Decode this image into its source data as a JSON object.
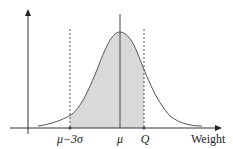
{
  "diagram": {
    "type": "normal-distribution-curve",
    "x_axis_label": "Weight",
    "markers": [
      {
        "id": "mu-minus-3sigma",
        "label": "μ−3σ",
        "line": "dashed"
      },
      {
        "id": "mu",
        "label": "μ",
        "line": "solid"
      },
      {
        "id": "q",
        "label": "Q",
        "line": "dashed"
      }
    ],
    "shaded_region": {
      "from": "μ−3σ",
      "to": "Q"
    },
    "colors": {
      "curve": "#555555",
      "fill": "#d9d9d9",
      "axis": "#333333"
    }
  }
}
